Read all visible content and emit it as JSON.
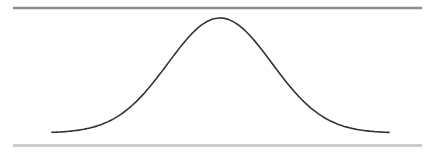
{
  "chart_data": {
    "type": "line",
    "title": "",
    "xlabel": "",
    "ylabel": "",
    "series": [
      {
        "name": "normal-curve",
        "distribution": "normal",
        "mean": 0,
        "std": 1,
        "x_range": [
          -3.2,
          3.2
        ],
        "color": "#333333"
      }
    ],
    "grid": false,
    "legend": false,
    "pixel_layout": {
      "curve_x_start": 52,
      "curve_x_end": 389,
      "peak_x": 220,
      "peak_y": 18,
      "baseline_y": 133,
      "sigma_px": 52
    },
    "rules": {
      "top": {
        "x1": 13,
        "x2": 422,
        "y": 8,
        "color": "#8c8c8c",
        "thickness": 2.5
      },
      "bottom": {
        "x1": 13,
        "x2": 422,
        "y": 145.5,
        "color": "#cccccc",
        "thickness": 3
      }
    }
  }
}
